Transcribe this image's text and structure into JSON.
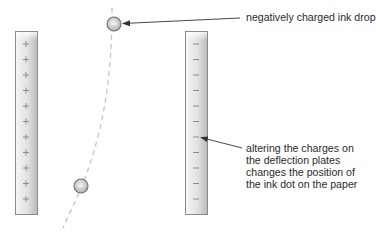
{
  "diagram": {
    "labels": {
      "ink_drop": "negatively charged ink drop",
      "plates_lines": [
        "altering the charges on",
        "the deflection plates",
        "changes the position of",
        "the ink dot on the paper"
      ]
    },
    "plates": [
      {
        "name": "positive-plate",
        "sign": "+",
        "count": 11
      },
      {
        "name": "negative-plate",
        "sign": "−",
        "count": 11
      }
    ],
    "ink_drops": [
      {
        "name": "ink-drop-top",
        "charge": "−"
      },
      {
        "name": "ink-drop-bottom",
        "charge": "−"
      }
    ],
    "colors": {
      "plate_edge": "#8a8a8a",
      "plate_light": "#f4f4f4",
      "plate_dark": "#bdbdbd",
      "sign": "#8c8c8c",
      "drop_fill": "#cfcfcf",
      "drop_edge": "#6e6e6e",
      "trajectory": "#bdbdbd",
      "arrow": "#333333",
      "text": "#2a2a2a"
    }
  }
}
